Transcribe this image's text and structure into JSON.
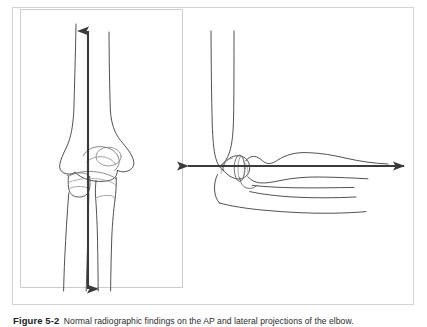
{
  "document": {
    "page_background": "#ffffff",
    "figure": {
      "frame_border_color": "#cfd2d6",
      "panel_border_color": "#c9ccd1"
    }
  },
  "caption": {
    "label": "Figure 5-2",
    "text": "Normal radiographic findings on the AP and lateral projections of the elbow.",
    "label_color": "#1c1c1c",
    "text_color": "#2b2b2b"
  },
  "panels": [
    {
      "id": "ap-projection",
      "name": "AP projection",
      "bordered": true,
      "annotation": {
        "type": "double-headed-arrow",
        "orientation": "vertical",
        "color": "#3a3a3a"
      }
    },
    {
      "id": "lateral-projection",
      "name": "Lateral projection",
      "bordered": false,
      "annotation": {
        "type": "double-headed-arrow",
        "orientation": "horizontal",
        "color": "#3a3a3a"
      }
    }
  ],
  "line_art": {
    "stroke_color": "#3d3d3d",
    "stroke_color_light": "#6e6e6e",
    "fill": "none",
    "subject": "elbow bones line drawing"
  }
}
